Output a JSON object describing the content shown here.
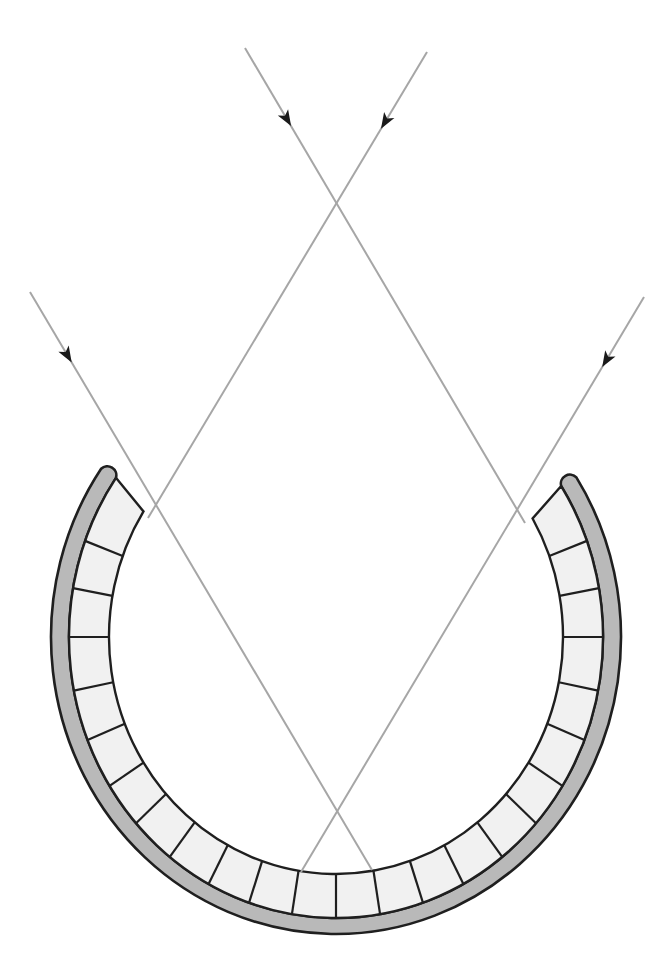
{
  "diagram": {
    "title": "Parallel light rays reflecting into a segmented concave reflector",
    "canvas": {
      "width": 671,
      "height": 972,
      "background": "#ffffff"
    },
    "colors": {
      "ray": "#a6a6a6",
      "arrow": "#1a1a1a",
      "outline": "#1f1f1f",
      "outer_band": "#b9b9b9",
      "cells": "#f1f1f1"
    },
    "reflector": {
      "center": [
        336,
        637
      ],
      "inner": {
        "rx": 227,
        "ry": 237
      },
      "band_boundary": {
        "rx": 267,
        "ry": 281
      },
      "outer": {
        "rx": 285,
        "ry": 297
      },
      "cell_end_angles": [
        -122,
        120
      ],
      "band_end_angles": [
        -124.5,
        122.5
      ],
      "divider_angles": [
        -110,
        -100,
        -90,
        -79,
        -68.5,
        -58,
        -48.5,
        -38.5,
        -28.5,
        -19,
        -9.5,
        0,
        9.5,
        19,
        28.5,
        38.5,
        48.5,
        58,
        68.5,
        79,
        90,
        100,
        110
      ],
      "cell_count": 24
    },
    "rays": [
      {
        "name": "ray-top-left",
        "from": [
          245,
          48
        ],
        "to": [
          525,
          523
        ],
        "arrow_at": 0.15
      },
      {
        "name": "ray-top-right",
        "from": [
          427,
          52
        ],
        "to": [
          148,
          518
        ],
        "arrow_at": 0.15
      },
      {
        "name": "ray-left",
        "from": [
          30,
          292
        ],
        "to": [
          372,
          870
        ],
        "arrow_at": 0.11
      },
      {
        "name": "ray-right",
        "from": [
          644,
          297
        ],
        "to": [
          301,
          872
        ],
        "arrow_at": 0.11
      }
    ],
    "labels": {
      "reflector": "segmented concave reflector",
      "rays": "incoming parallel rays with direction arrows"
    }
  }
}
